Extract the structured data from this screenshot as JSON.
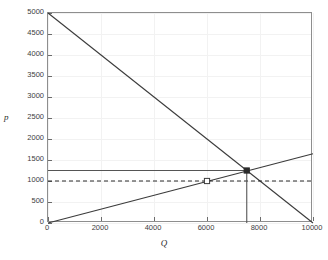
{
  "chart_data": {
    "type": "line",
    "title": "",
    "xlabel": "Q",
    "ylabel": "p",
    "xlim": [
      0,
      10000
    ],
    "ylim": [
      0,
      5000
    ],
    "grid": true,
    "legend": "none",
    "xticks": [
      0,
      2000,
      4000,
      6000,
      8000,
      10000
    ],
    "xticklabels": [
      "0",
      "2000",
      "4000",
      "6000",
      "8000",
      "10000"
    ],
    "yticks": [
      0,
      500,
      1000,
      1500,
      2000,
      2500,
      3000,
      3500,
      4000,
      4500,
      5000
    ],
    "yticklabels": [
      "0",
      "500",
      "1000",
      "1500",
      "2000",
      "2500",
      "3000",
      "3500",
      "4000",
      "4500",
      "5000"
    ],
    "series": [
      {
        "name": "demand",
        "type": "line",
        "style": "solid",
        "color": "#3b3b3b",
        "x": [
          0,
          10000
        ],
        "y": [
          5000,
          0
        ],
        "slope": -0.5,
        "intercept": 5000
      },
      {
        "name": "supply",
        "type": "line",
        "style": "solid",
        "color": "#3b3b3b",
        "x": [
          0,
          10000
        ],
        "y": [
          0,
          1650
        ],
        "slope": 0.165,
        "intercept": 0
      },
      {
        "name": "price-line-solid",
        "type": "line",
        "style": "solid",
        "color": "#555555",
        "x": [
          0,
          7500
        ],
        "y": [
          1250,
          1250
        ]
      },
      {
        "name": "price-line-dashed",
        "type": "line",
        "style": "dashed",
        "color": "#2b2b2b",
        "x": [
          0,
          10000
        ],
        "y": [
          1000,
          1000
        ]
      },
      {
        "name": "equilibrium-drop-line",
        "type": "line",
        "style": "solid",
        "color": "#555555",
        "x": [
          7500,
          7500
        ],
        "y": [
          0,
          1250
        ]
      }
    ],
    "markers": [
      {
        "name": "equilibrium-point",
        "shape": "square",
        "fill": "filled",
        "color": "#2b2b2b",
        "x": 7500,
        "y": 1250
      },
      {
        "name": "secondary-point",
        "shape": "square",
        "fill": "open",
        "color": "#3b3b3b",
        "x": 6000,
        "y": 1000
      }
    ]
  },
  "axes": {
    "y_label": "p",
    "x_label": "Q"
  }
}
